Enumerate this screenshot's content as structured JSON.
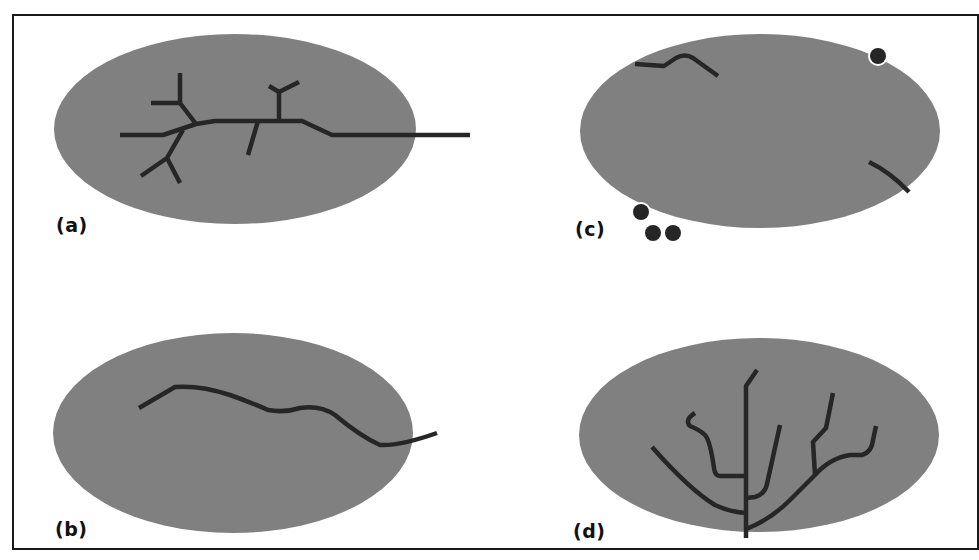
{
  "colors": {
    "cell": "#808080",
    "process": "#262626",
    "dot": "#262626",
    "frame": "#1a1a1a",
    "background": "#ffffff"
  },
  "panels": [
    {
      "id": "a",
      "label": "(a)",
      "description": "cell with branched process extending beyond right edge"
    },
    {
      "id": "b",
      "label": "(b)",
      "description": "cell with single wavy unbranched process"
    },
    {
      "id": "c",
      "label": "(c)",
      "description": "cell with fragmented process segments and detached dots at boundary"
    },
    {
      "id": "d",
      "label": "(d)",
      "description": "cell with tree-like branching process from a central trunk"
    }
  ]
}
